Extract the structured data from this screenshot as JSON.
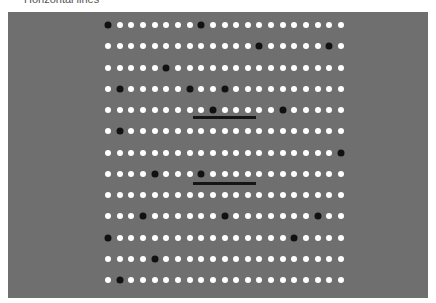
{
  "header": {
    "title": "Horizontal lines"
  },
  "stimulus": {
    "background_color": "#6f6f6f",
    "dot_color_white": "#ffffff",
    "dot_color_black": "#111111",
    "columns": 21,
    "rows": 13,
    "grid": {
      "first_x": 100,
      "first_y": 13,
      "dx": 11.65,
      "dy": 21.25
    },
    "black_dots": [
      [
        0,
        8
      ],
      [
        13,
        19
      ],
      [
        5
      ],
      [
        1,
        7,
        10
      ],
      [
        9,
        15
      ],
      [
        1
      ],
      [
        20
      ],
      [
        4,
        8
      ],
      [],
      [
        3,
        10,
        18
      ],
      [
        0,
        16
      ],
      [
        4
      ],
      [
        1
      ]
    ],
    "bars": [
      {
        "x1": 185,
        "x2": 248,
        "y": 105
      },
      {
        "x1": 185,
        "x2": 248,
        "y": 171
      }
    ]
  }
}
